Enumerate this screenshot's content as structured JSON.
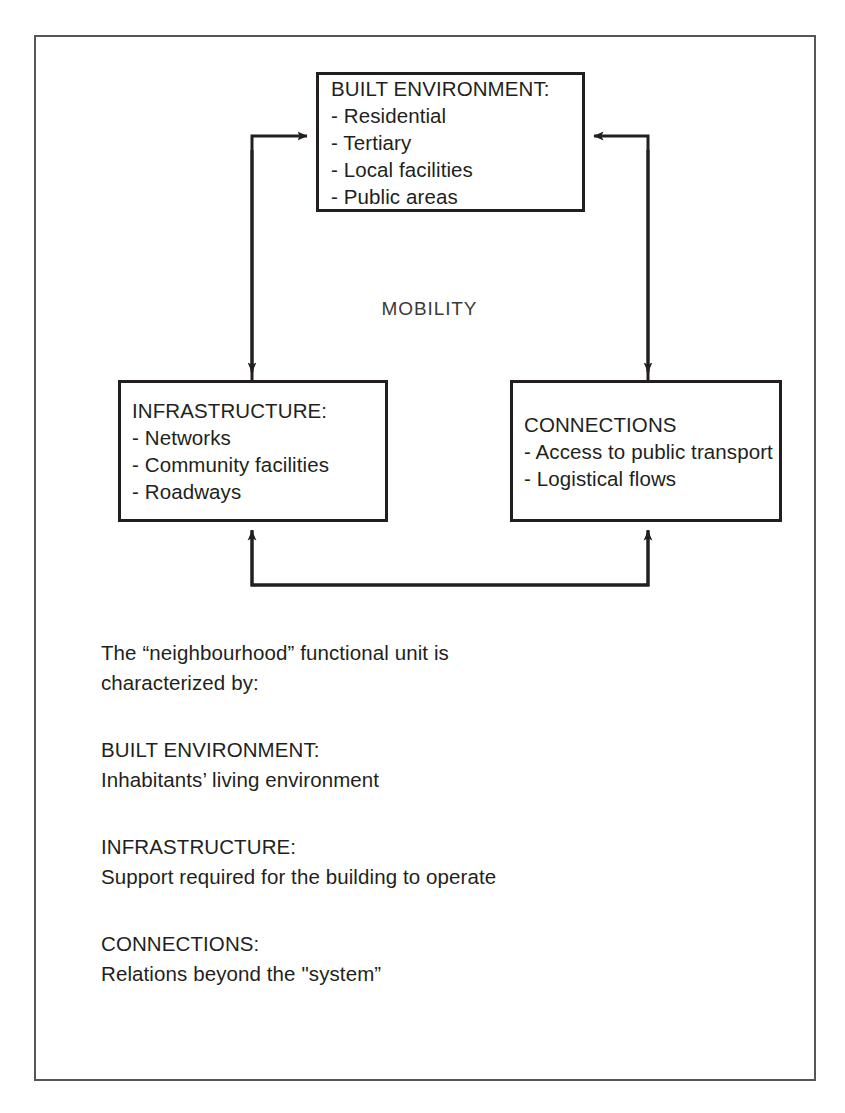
{
  "diagram": {
    "title_label": "MOBILITY",
    "nodes": [
      {
        "id": "built-environment",
        "title": "BUILT ENVIRONMENT:",
        "items": [
          "- Residential",
          "- Tertiary",
          "- Local facilities",
          "- Public areas"
        ]
      },
      {
        "id": "infrastructure",
        "title": "INFRASTRUCTURE:",
        "items": [
          "- Networks",
          "- Community facilities",
          "- Roadways"
        ]
      },
      {
        "id": "connections",
        "title": "CONNECTIONS",
        "items": [
          "- Access to public transport",
          "- Logistical flows"
        ]
      }
    ],
    "colors": {
      "frame": "#565656",
      "box_border": "#231f20",
      "connector": "#231f20",
      "text": "#231f20",
      "background": "#ffffff"
    }
  },
  "caption": {
    "intro": {
      "line1": "The “neighbourhood” functional unit is",
      "line2": "characterized by:"
    },
    "sections": [
      {
        "heading": "BUILT ENVIRONMENT:",
        "body": "Inhabitants’ living environment"
      },
      {
        "heading": "INFRASTRUCTURE:",
        "body": "Support required for the building to operate"
      },
      {
        "heading": "CONNECTIONS:",
        "body": "Relations beyond the \"system”"
      }
    ]
  }
}
